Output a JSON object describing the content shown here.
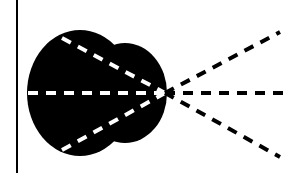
{
  "diagram": {
    "colors": {
      "background": "#ffffff",
      "shape": "#000000",
      "inner_dash": "#ffffff",
      "outer_dash": "#000000"
    },
    "border_line": {
      "x": 17,
      "y1": 0,
      "y2": 173
    },
    "blob": {
      "main_circle": {
        "cx": 80,
        "cy": 93,
        "rx": 53,
        "ry": 63
      },
      "lobe": {
        "cx": 125,
        "cy": 93,
        "rx": 42,
        "ry": 50
      }
    },
    "focus_point": {
      "x": 165,
      "y": 93
    },
    "inner_rays": [
      {
        "x1": 62,
        "y1": 38,
        "x2": 165,
        "y2": 93
      },
      {
        "x1": 28,
        "y1": 93,
        "x2": 165,
        "y2": 93
      },
      {
        "x1": 62,
        "y1": 150,
        "x2": 165,
        "y2": 93
      }
    ],
    "outer_rays": [
      {
        "x1": 165,
        "y1": 93,
        "x2": 280,
        "y2": 32
      },
      {
        "x1": 165,
        "y1": 93,
        "x2": 291,
        "y2": 93
      },
      {
        "x1": 165,
        "y1": 93,
        "x2": 280,
        "y2": 157
      }
    ]
  }
}
